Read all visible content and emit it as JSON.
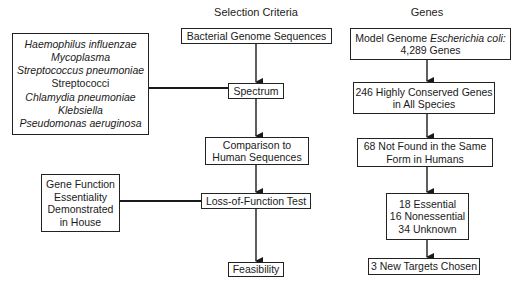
{
  "headers": {
    "selection_criteria": "Selection Criteria",
    "genes": "Genes"
  },
  "species_box": {
    "items": [
      {
        "text": "Haemophilus influenzae",
        "italic": true
      },
      {
        "text": "Mycoplasma",
        "italic": true
      },
      {
        "text": "Streptococcus pneumoniae",
        "italic": true
      },
      {
        "text": "Streptococci",
        "italic": false
      },
      {
        "text": "Chlamydia pneumoniae",
        "italic": true
      },
      {
        "text": "Klebsiella",
        "italic": true
      },
      {
        "text": "Pseudomonas aeruginosa",
        "italic": true
      }
    ]
  },
  "gene_function_box": {
    "lines": [
      "Gene Function",
      "Essentiality",
      "Demonstrated",
      "in House"
    ]
  },
  "criteria": {
    "bacterial_genome": "Bacterial Genome Sequences",
    "spectrum": "Spectrum",
    "comparison": [
      "Comparison to",
      "Human Sequences"
    ],
    "loss_of_function": "Loss-of-Function Test",
    "feasibility": "Feasibility"
  },
  "genes": {
    "model_genome": {
      "prefix": "Model Genome ",
      "organism": "Escherichia coli:",
      "count": "4,289 Genes"
    },
    "conserved": [
      "246 Highly Conserved Genes",
      "in All Species"
    ],
    "not_found": [
      "68 Not Found in the Same",
      "Form in Humans"
    ],
    "breakdown": [
      "18 Essential",
      "16 Nonessential",
      "34 Unknown"
    ],
    "targets": "3 New Targets Chosen"
  }
}
